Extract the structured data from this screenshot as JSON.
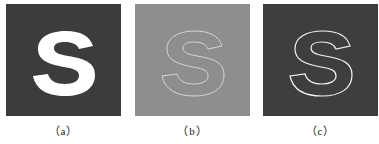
{
  "figure": {
    "panels": [
      {
        "id": "a",
        "caption": "（a）",
        "description": "solid white S on dark background",
        "background": "#3c3c3c",
        "fill": "#ffffff",
        "stroke": "none"
      },
      {
        "id": "b",
        "caption": "（b）",
        "description": "S outline edges on mid-gray background",
        "background": "#8e8e8e",
        "fill": "none",
        "stroke": "#d6d6d6"
      },
      {
        "id": "c",
        "caption": "（c）",
        "description": "white S outline on dark background",
        "background": "#3e3e3e",
        "fill": "none",
        "stroke": "#f2f2f2"
      }
    ],
    "glyph": "S"
  }
}
